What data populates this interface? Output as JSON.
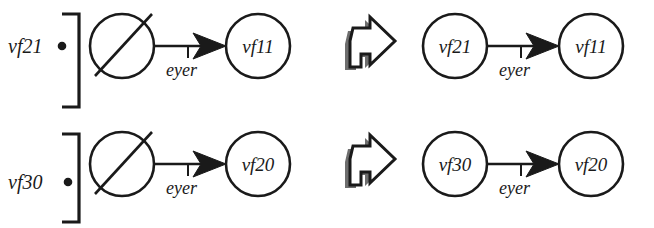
{
  "diagram": {
    "background_color": "#ffffff",
    "ink_color": "#1a1a1a",
    "shadow_color": "#6e6e6e",
    "rows": [
      {
        "id": "row-1",
        "external_label": {
          "text": "vf21",
          "dot_symbol": "filled-circle",
          "icon_name": "external-port-dot-icon"
        },
        "bracket": {
          "symbol": "]",
          "icon_name": "right-square-bracket-icon"
        },
        "left_pattern": {
          "source_node": {
            "label": "",
            "marker": "slashed-circle",
            "icon_name": "slashed-circle-node-icon"
          },
          "edge": {
            "label": "eyer",
            "direction": "right",
            "arrowhead": "filled-triangle",
            "tick": true
          },
          "target_node": {
            "label": "vf11"
          }
        },
        "transform_arrow": {
          "icon_name": "block-arrow-right-icon",
          "style": "hollow-with-shadow"
        },
        "right_pattern": {
          "source_node": {
            "label": "vf21",
            "marker": "plain-circle"
          },
          "edge": {
            "label": "eyer",
            "direction": "right",
            "arrowhead": "filled-triangle",
            "tick": true
          },
          "target_node": {
            "label": "vf11"
          }
        }
      },
      {
        "id": "row-2",
        "external_label": {
          "text": "vf30",
          "dot_symbol": "filled-circle",
          "icon_name": "external-port-dot-icon"
        },
        "bracket": {
          "symbol": "]",
          "icon_name": "right-square-bracket-icon"
        },
        "left_pattern": {
          "source_node": {
            "label": "",
            "marker": "slashed-circle",
            "icon_name": "slashed-circle-node-icon"
          },
          "edge": {
            "label": "eyer",
            "direction": "right",
            "arrowhead": "filled-triangle",
            "tick": true
          },
          "target_node": {
            "label": "vf20"
          }
        },
        "transform_arrow": {
          "icon_name": "block-arrow-right-icon",
          "style": "hollow-with-shadow"
        },
        "right_pattern": {
          "source_node": {
            "label": "vf30",
            "marker": "plain-circle"
          },
          "edge": {
            "label": "eyer",
            "direction": "right",
            "arrowhead": "filled-triangle",
            "tick": true
          },
          "target_node": {
            "label": "vf20"
          }
        }
      }
    ]
  }
}
